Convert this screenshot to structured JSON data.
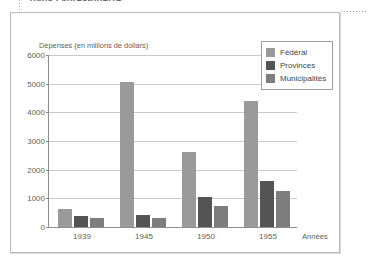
{
  "page": {
    "top_caption": "dans l'après-guerre"
  },
  "chart_data": {
    "type": "bar",
    "title": "",
    "ylabel": "Dépenses (en millions de dollars)",
    "xlabel": "Années",
    "categories": [
      "1939",
      "1945",
      "1950",
      "1955"
    ],
    "series": [
      {
        "name": "Fédéral",
        "color": "#9a9a9a",
        "values": [
          620,
          5050,
          2600,
          4400
        ]
      },
      {
        "name": "Provinces",
        "color": "#545454",
        "values": [
          400,
          420,
          1050,
          1620
        ]
      },
      {
        "name": "Municipalités",
        "color": "#7d7d7d",
        "values": [
          300,
          320,
          730,
          1240
        ]
      }
    ],
    "ylim": [
      0,
      6000
    ],
    "yticks": [
      0,
      1000,
      2000,
      3000,
      4000,
      5000,
      6000
    ],
    "ytick_labels": [
      "0",
      "1000",
      "2000",
      "3000",
      "4000",
      "5000",
      "6000"
    ],
    "grid": true,
    "legend_position": "top-right",
    "colors": {
      "federal": "#9a9a9a",
      "provinces": "#545454",
      "municipalites": "#7d7d7d",
      "gridline": "#c9c9c9",
      "axis": "#8d8d8d",
      "frame": "#b9b9b9",
      "text": "#5e5e5e"
    }
  }
}
